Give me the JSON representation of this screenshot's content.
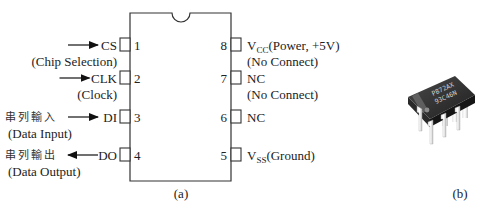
{
  "figure_a": {
    "caption": "(a)",
    "left_pins": [
      {
        "number": "1",
        "name": "CS",
        "description": "(Chip Selection)",
        "direction": "in",
        "cjk_label": ""
      },
      {
        "number": "2",
        "name": "CLK",
        "description": "(Clock)",
        "direction": "in",
        "cjk_label": ""
      },
      {
        "number": "3",
        "name": "DI",
        "description": "(Data Input)",
        "direction": "in",
        "cjk_label": "串列輸入"
      },
      {
        "number": "4",
        "name": "DO",
        "description": "(Data Output)",
        "direction": "out",
        "cjk_label": "串列輸出"
      }
    ],
    "right_pins": [
      {
        "number": "8",
        "name_main": "V",
        "name_sub": "CC",
        "name_rest": "(Power, +5V)",
        "description": "(No Connect)"
      },
      {
        "number": "7",
        "name_main": "NC",
        "name_sub": "",
        "name_rest": "",
        "description": "(No Connect)"
      },
      {
        "number": "6",
        "name_main": "NC",
        "name_sub": "",
        "name_rest": "",
        "description": ""
      },
      {
        "number": "5",
        "name_main": "V",
        "name_sub": "SS",
        "name_rest": "(Ground)",
        "description": ""
      }
    ]
  },
  "figure_b": {
    "caption": "(b)",
    "chip_marking_line1": "P872AX",
    "chip_marking_line2": "93C46N"
  }
}
